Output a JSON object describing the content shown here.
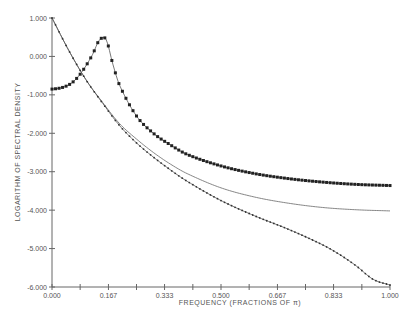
{
  "chart_data": {
    "type": "line",
    "title": "",
    "xlabel": "FREQUENCY (FRACTIONS OF π)",
    "ylabel": "LOGARITHM OF SPECTRAL DENSITY",
    "xlim": [
      0,
      1
    ],
    "ylim": [
      -6,
      1
    ],
    "grid": false,
    "legend": null,
    "x_ticks": [
      "0.000",
      "0.167",
      "0.333",
      "0.500",
      "0.667",
      "0.833",
      "1.000"
    ],
    "x_tick_values": [
      0,
      0.167,
      0.333,
      0.5,
      0.667,
      0.833,
      1.0
    ],
    "x_minor_ticks": [
      0.0833,
      0.25,
      0.4167,
      0.5833,
      0.75,
      0.9167
    ],
    "y_ticks": [
      "1.000",
      "0.000",
      "-1.000",
      "-2.000",
      "-3.000",
      "-4.000",
      "-5.000",
      "-6.000"
    ],
    "y_tick_values": [
      1,
      0,
      -1,
      -2,
      -3,
      -4,
      -5,
      -6
    ],
    "series": [
      {
        "name": "peaked-spectrum",
        "style": "thick-dotted",
        "x": [
          0,
          0.02,
          0.04,
          0.06,
          0.08,
          0.1,
          0.12,
          0.14,
          0.16,
          0.18,
          0.2,
          0.25,
          0.3,
          0.35,
          0.4,
          0.5,
          0.6,
          0.7,
          0.8,
          0.9,
          1.0
        ],
        "values": [
          -0.85,
          -0.83,
          -0.78,
          -0.68,
          -0.5,
          -0.25,
          0.05,
          0.42,
          0.44,
          -0.2,
          -0.75,
          -1.55,
          -2.0,
          -2.3,
          -2.55,
          -2.85,
          -3.05,
          -3.18,
          -3.27,
          -3.33,
          -3.36
        ]
      },
      {
        "name": "smooth-spectrum",
        "style": "thin-solid",
        "x": [
          0,
          0.05,
          0.1,
          0.15,
          0.2,
          0.25,
          0.3,
          0.35,
          0.4,
          0.5,
          0.6,
          0.7,
          0.8,
          0.9,
          1.0
        ],
        "values": [
          1.0,
          0.15,
          -0.6,
          -1.2,
          -1.75,
          -2.15,
          -2.5,
          -2.8,
          -3.05,
          -3.42,
          -3.66,
          -3.82,
          -3.93,
          -3.99,
          -4.02
        ]
      },
      {
        "name": "estimated-spectrum",
        "style": "thin-small-dots",
        "x": [
          0,
          0.05,
          0.1,
          0.15,
          0.2,
          0.25,
          0.3,
          0.35,
          0.4,
          0.5,
          0.6,
          0.7,
          0.8,
          0.85,
          0.9,
          0.95,
          1.0
        ],
        "values": [
          1.0,
          0.15,
          -0.6,
          -1.22,
          -1.8,
          -2.25,
          -2.62,
          -2.95,
          -3.25,
          -3.75,
          -4.15,
          -4.5,
          -4.9,
          -5.15,
          -5.45,
          -5.8,
          -5.95
        ]
      }
    ]
  }
}
